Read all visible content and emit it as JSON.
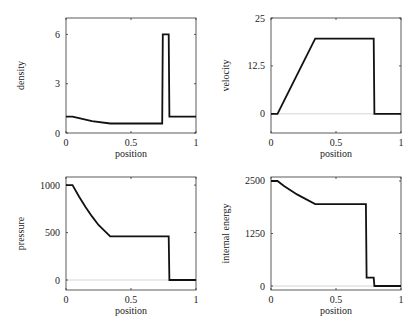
{
  "chart_data": [
    {
      "type": "line",
      "title": "",
      "xlabel": "position",
      "ylabel": "density",
      "xlim": [
        0,
        1
      ],
      "ylim": [
        0,
        7
      ],
      "xticks": [
        "0",
        "0.5",
        "1"
      ],
      "xtick_values": [
        0,
        0.5,
        1
      ],
      "yticks": [
        "0",
        "3",
        "6"
      ],
      "ytick_values": [
        0,
        3,
        6
      ],
      "zero_line": true,
      "x": [
        0,
        0.05,
        0.1,
        0.2,
        0.34,
        0.5,
        0.74,
        0.745,
        0.79,
        0.795,
        1.0
      ],
      "values": [
        1.0,
        1.0,
        0.9,
        0.72,
        0.58,
        0.58,
        0.58,
        6.0,
        6.0,
        1.0,
        1.0
      ]
    },
    {
      "type": "line",
      "title": "",
      "xlabel": "position",
      "ylabel": "velocity",
      "xlim": [
        0,
        1
      ],
      "ylim": [
        -5,
        25
      ],
      "xticks": [
        "0",
        "0.5",
        "1"
      ],
      "xtick_values": [
        0,
        0.5,
        1
      ],
      "yticks": [
        "0",
        "12.5",
        "25"
      ],
      "ytick_values": [
        0,
        12.5,
        25
      ],
      "zero_line": true,
      "x": [
        0,
        0.05,
        0.34,
        0.79,
        0.795,
        1.0
      ],
      "values": [
        0,
        0,
        19.6,
        19.6,
        0,
        0
      ]
    },
    {
      "type": "line",
      "title": "",
      "xlabel": "position",
      "ylabel": "pressure",
      "xlim": [
        0,
        1
      ],
      "ylim": [
        -105,
        1085
      ],
      "xticks": [
        "0",
        "0.5",
        "1"
      ],
      "xtick_values": [
        0,
        0.5,
        1
      ],
      "yticks": [
        "0",
        "500",
        "1000"
      ],
      "ytick_values": [
        0,
        500,
        1000
      ],
      "zero_line": true,
      "x": [
        0,
        0.05,
        0.1,
        0.15,
        0.2,
        0.25,
        0.34,
        0.5,
        0.79,
        0.795,
        1.0
      ],
      "values": [
        1000,
        1000,
        880,
        770,
        670,
        580,
        460,
        460,
        460,
        0.01,
        0.01
      ]
    },
    {
      "type": "line",
      "title": "",
      "xlabel": "position",
      "ylabel": "internal energy",
      "xlim": [
        0,
        1
      ],
      "ylim": [
        -95,
        2595
      ],
      "xticks": [
        "0",
        "0.5",
        "1"
      ],
      "xtick_values": [
        0,
        0.5,
        1
      ],
      "yticks": [
        "0",
        "1250",
        "2500"
      ],
      "ytick_values": [
        0,
        1250,
        2500
      ],
      "zero_line": true,
      "x": [
        0,
        0.05,
        0.1,
        0.2,
        0.34,
        0.5,
        0.73,
        0.735,
        0.79,
        0.795,
        1.0
      ],
      "values": [
        2500,
        2500,
        2380,
        2180,
        1950,
        1950,
        1950,
        200,
        200,
        0.01,
        0.01
      ]
    }
  ],
  "panels": [
    {
      "ylabel": "density",
      "xlabel": "position",
      "frame": {
        "x": 66,
        "y": 18,
        "w": 130,
        "h": 115
      }
    },
    {
      "ylabel": "velocity",
      "xlabel": "position",
      "frame": {
        "x": 271,
        "y": 18,
        "w": 130,
        "h": 115
      }
    },
    {
      "ylabel": "pressure",
      "xlabel": "position",
      "frame": {
        "x": 66,
        "y": 177,
        "w": 130,
        "h": 113
      }
    },
    {
      "ylabel": "internal energy",
      "xlabel": "position",
      "frame": {
        "x": 271,
        "y": 177,
        "w": 130,
        "h": 113
      }
    }
  ]
}
